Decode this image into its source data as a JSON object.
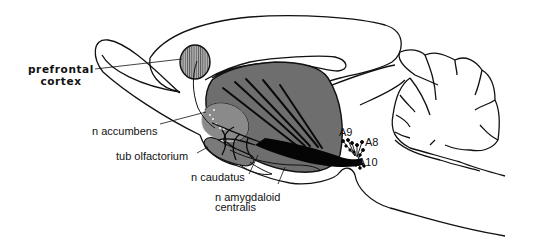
{
  "figure": {
    "colors": {
      "outline": "#111111",
      "striatum_fill": "#6e6e6e",
      "accumbens_fill": "#8a8a8a",
      "prefrontal_fill": "#9a9a9a",
      "fiber": "#0a0a0a",
      "background": "#ffffff"
    }
  },
  "labels": {
    "prefrontal_line1": "prefrontal",
    "prefrontal_line2": "cortex",
    "accumbens": "n accumbens",
    "olfactorium": "tub olfactorium",
    "caudatus": "n caudatus",
    "amygdaloid_line1": "n amygdaloid",
    "amygdaloid_line2": "centralis",
    "a9": "A9",
    "a8": "A8",
    "a10": "A10"
  }
}
